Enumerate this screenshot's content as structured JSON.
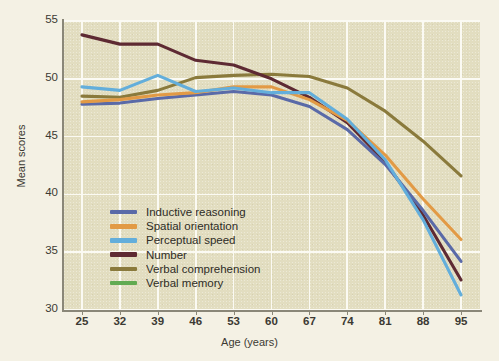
{
  "chart_data": {
    "type": "line",
    "title": "",
    "xlabel": "Age (years)",
    "ylabel": "Mean scores",
    "x": [
      25,
      32,
      39,
      46,
      53,
      60,
      67,
      74,
      81,
      88,
      95
    ],
    "categories": [
      "25",
      "32",
      "39",
      "46",
      "53",
      "60",
      "67",
      "74",
      "81",
      "88",
      "95"
    ],
    "xlim": [
      21.5,
      98.5
    ],
    "ylim": [
      30,
      55
    ],
    "yticks": [
      30,
      35,
      40,
      45,
      50,
      55
    ],
    "xticks": [
      25,
      32,
      39,
      46,
      53,
      60,
      67,
      74,
      81,
      88,
      95
    ],
    "grid": true,
    "legend_position": "lower-left-inside",
    "series": [
      {
        "name": "Inductive reasoning",
        "color": "#5a6aa8",
        "values": [
          47.8,
          47.9,
          48.3,
          48.6,
          48.9,
          48.6,
          47.6,
          45.6,
          42.6,
          38.6,
          34.2
        ]
      },
      {
        "name": "Spatial orientation",
        "color": "#e29a45",
        "values": [
          48.0,
          48.2,
          48.6,
          48.8,
          49.3,
          49.3,
          48.2,
          46.4,
          43.4,
          39.6,
          36.1
        ]
      },
      {
        "name": "Perceptual speed",
        "color": "#63aedb",
        "values": [
          49.3,
          49.0,
          50.3,
          48.9,
          49.2,
          48.8,
          48.8,
          46.5,
          43.0,
          37.8,
          31.3
        ]
      },
      {
        "name": "Number",
        "color": "#5e2a33",
        "values": [
          53.8,
          53.0,
          53.0,
          51.6,
          51.2,
          50.0,
          48.4,
          46.2,
          42.8,
          38.2,
          32.6
        ]
      },
      {
        "name": "Verbal comprehension",
        "color": "#8a7a3c",
        "values": [
          48.5,
          48.4,
          49.0,
          50.1,
          50.3,
          50.4,
          50.2,
          49.2,
          47.2,
          44.6,
          41.6
        ]
      },
      {
        "name": "Verbal memory",
        "color": "#62a martinez"
      }
    ]
  },
  "axis": {
    "y_title": "Mean scores",
    "x_title": "Age (years)",
    "y_ticks": [
      "55",
      "50",
      "45",
      "40",
      "35",
      "30"
    ],
    "x_ticks": [
      "25",
      "32",
      "39",
      "46",
      "53",
      "60",
      "67",
      "74",
      "81",
      "88",
      "95"
    ]
  },
  "legend": {
    "items": [
      {
        "label": "Inductive reasoning",
        "color": "#5a6aa8"
      },
      {
        "label": "Spatial orientation",
        "color": "#e29a45"
      },
      {
        "label": "Perceptual speed",
        "color": "#63aedb"
      },
      {
        "label": "Number",
        "color": "#5e2a33"
      },
      {
        "label": "Verbal comprehension",
        "color": "#8a7a3c"
      },
      {
        "label": "Verbal memory",
        "color": "#62ab52"
      }
    ]
  },
  "caption": {
    "text": ""
  },
  "colors": {
    "plot_background": "#e2ddc0",
    "page_background": "#f4f1e4",
    "gridline": "#fbfaf3",
    "axis": "#8a8778",
    "text": "#3c3a33"
  }
}
